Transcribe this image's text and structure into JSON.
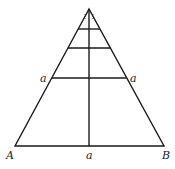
{
  "diagram": {
    "type": "triangle-with-median-and-parallel-cuts",
    "labels": {
      "vertex_left": "A",
      "vertex_right": "B",
      "base_midpoint": "a",
      "left_side_point": "a",
      "right_side_point": "a",
      "apex_marks": "⁞⁞"
    },
    "colors": {
      "stroke": "#1a1a1a",
      "background": "#ffffff"
    }
  }
}
